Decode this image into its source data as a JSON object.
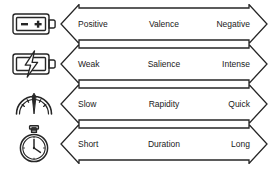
{
  "figure": {
    "background": "#ffffff",
    "stroke_color": "#262626",
    "text_color": "#1a1a1a"
  },
  "rows": [
    {
      "icon": "battery-polarity-icon",
      "icon_label": "Battery with minus and plus terminals",
      "low": "Positive",
      "name": "Valence",
      "high": "Negative"
    },
    {
      "icon": "battery-lightning-icon",
      "icon_label": "Battery with lightning bolt",
      "low": "Weak",
      "name": "Salience",
      "high": "Intense"
    },
    {
      "icon": "speedometer-gauge-icon",
      "icon_label": "Speedometer gauge with needle",
      "low": "Slow",
      "name": "Rapidity",
      "high": "Quick"
    },
    {
      "icon": "stopwatch-icon",
      "icon_label": "Stopwatch with clock hands",
      "low": "Short",
      "name": "Duration",
      "high": "Long"
    }
  ]
}
